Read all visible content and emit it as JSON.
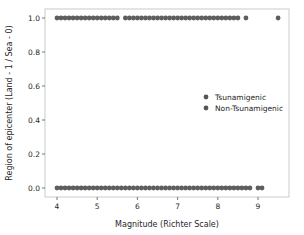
{
  "chart_data": {
    "type": "scatter",
    "title": "",
    "xlabel": "Magnitude (Richter Scale)",
    "ylabel": "Region of epicenter (Land - 1 / Sea - 0)",
    "xlim": [
      3.7,
      9.8
    ],
    "ylim": [
      -0.05,
      1.05
    ],
    "xticks": [
      4,
      5,
      6,
      7,
      8,
      9
    ],
    "yticks": [
      0.0,
      0.2,
      0.4,
      0.6,
      0.8,
      1.0
    ],
    "ytick_labels": [
      "0.0",
      "0.2",
      "0.4",
      "0.6",
      "0.8",
      "1.0"
    ],
    "grid": false,
    "legend_position": "center right",
    "series": [
      {
        "name": "Tsunamigenic",
        "color": "#555555",
        "y": 1,
        "segments": [
          [
            4.0,
            5.5
          ],
          [
            5.7,
            8.5
          ]
        ],
        "isolated_x": [
          8.7,
          9.5
        ]
      },
      {
        "name": "Non-Tsunamigenic",
        "color": "#555555",
        "y": 0,
        "segments": [
          [
            4.0,
            8.8
          ]
        ],
        "isolated_x": [
          9.0,
          9.1
        ]
      }
    ],
    "step": 0.1
  },
  "legend": {
    "items": [
      {
        "label": "Tsunamigenic",
        "color": "#555555"
      },
      {
        "label": "Non-Tsunamigenic",
        "color": "#555555"
      }
    ]
  }
}
